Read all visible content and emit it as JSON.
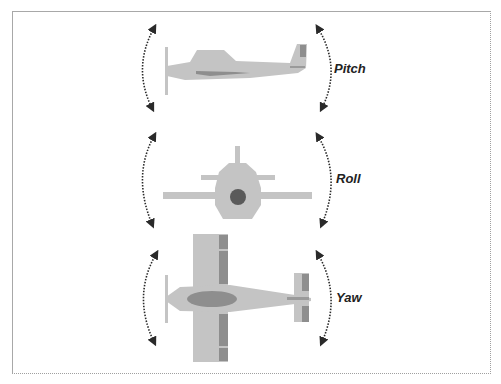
{
  "figure": {
    "panels": [
      {
        "id": "pitch",
        "label": "Pitch",
        "view": "side"
      },
      {
        "id": "roll",
        "label": "Roll",
        "view": "front"
      },
      {
        "id": "yaw",
        "label": "Yaw",
        "view": "top"
      }
    ]
  },
  "colors": {
    "airframe": "#c4c4c4",
    "accent": "#8e8e8e",
    "hub": "#5a5a5a",
    "arrow": "#2a2a2a",
    "frame": "#a8a8a8"
  }
}
